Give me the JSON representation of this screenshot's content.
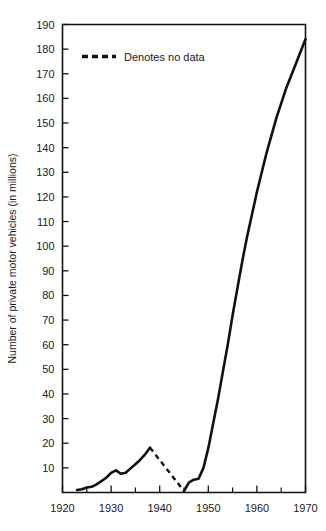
{
  "chart_data": {
    "type": "line",
    "title": "",
    "xlabel": "",
    "ylabel": "Number of private motor vehicles (in millions)",
    "xlim": [
      1920,
      1970
    ],
    "ylim": [
      0,
      190
    ],
    "grid": false,
    "x_ticks_major": [
      1920,
      1930,
      1940,
      1950,
      1960,
      1970
    ],
    "x_tick_labels": [
      "1920",
      "1930",
      "1940",
      "1950",
      "1960",
      "1970"
    ],
    "x_ticks_minor": [
      1925,
      1935,
      1945,
      1955,
      1965
    ],
    "y_ticks": [
      10,
      20,
      30,
      40,
      50,
      60,
      70,
      80,
      90,
      100,
      110,
      120,
      130,
      140,
      150,
      160,
      170,
      180,
      190
    ],
    "y_tick_labels": [
      "10",
      "20",
      "30",
      "40",
      "50",
      "60",
      "70",
      "80",
      "90",
      "100",
      "110",
      "120",
      "130",
      "140",
      "150",
      "160",
      "170",
      "180",
      "190"
    ],
    "legend": {
      "position": "top-left-inside",
      "entries": [
        {
          "label": "Denotes no data",
          "style": "dashed",
          "color": "#111111"
        }
      ]
    },
    "series": [
      {
        "name": "Private motor vehicles",
        "style": "solid",
        "color": "#111111",
        "x": [
          1923,
          1924,
          1925,
          1926,
          1927,
          1928,
          1929,
          1930,
          1931,
          1932,
          1933,
          1934,
          1935,
          1936,
          1937,
          1938
        ],
        "values": [
          1.0,
          1.3,
          2.0,
          2.3,
          3.3,
          4.6,
          6.0,
          8.0,
          9.0,
          7.6,
          8.0,
          9.8,
          11.5,
          13.3,
          15.5,
          18.2
        ]
      },
      {
        "name": "No data gap",
        "style": "dashed",
        "color": "#111111",
        "x": [
          1938,
          1945
        ],
        "values": [
          18.2,
          0.6
        ]
      },
      {
        "name": "Private motor vehicles (postwar)",
        "style": "solid",
        "color": "#111111",
        "x": [
          1945,
          1946,
          1947,
          1948,
          1949,
          1950,
          1951,
          1952,
          1953,
          1954,
          1955,
          1956,
          1957,
          1958,
          1959,
          1960,
          1961,
          1962,
          1963,
          1964,
          1965,
          1966,
          1967,
          1968,
          1969,
          1970
        ],
        "values": [
          0.6,
          4.0,
          5.2,
          5.6,
          10.0,
          18.0,
          28.0,
          38.0,
          49.0,
          60.0,
          72.0,
          83.0,
          94.0,
          104.0,
          113.0,
          122.0,
          130.0,
          138.0,
          145.0,
          152.0,
          158.0,
          164.0,
          169.0,
          174.0,
          179.0,
          184.0
        ]
      }
    ],
    "annotations": [],
    "colors": {
      "line": "#111111",
      "axis": "#111111",
      "background": "#ffffff"
    }
  }
}
